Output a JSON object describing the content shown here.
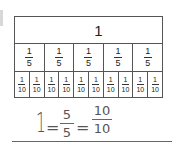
{
  "fraction_strip": {
    "whole": {
      "label": "1"
    },
    "fifths": [
      {
        "num": "1",
        "den": "5"
      },
      {
        "num": "1",
        "den": "5"
      },
      {
        "num": "1",
        "den": "5"
      },
      {
        "num": "1",
        "den": "5"
      },
      {
        "num": "1",
        "den": "5"
      }
    ],
    "tenths": [
      {
        "num": "1",
        "den": "10"
      },
      {
        "num": "1",
        "den": "10"
      },
      {
        "num": "1",
        "den": "10"
      },
      {
        "num": "1",
        "den": "10"
      },
      {
        "num": "1",
        "den": "10"
      },
      {
        "num": "1",
        "den": "10"
      },
      {
        "num": "1",
        "den": "10"
      },
      {
        "num": "1",
        "den": "10"
      },
      {
        "num": "1",
        "den": "10"
      },
      {
        "num": "1",
        "den": "10"
      }
    ]
  },
  "handwritten_answer": {
    "whole": "1",
    "equals": "=",
    "frac1": {
      "num": "5",
      "den": "5"
    },
    "frac2": {
      "num": "10",
      "den": "10"
    }
  },
  "colors": {
    "lines": "#555555",
    "ink": "#555555",
    "background": "#ffffff"
  }
}
